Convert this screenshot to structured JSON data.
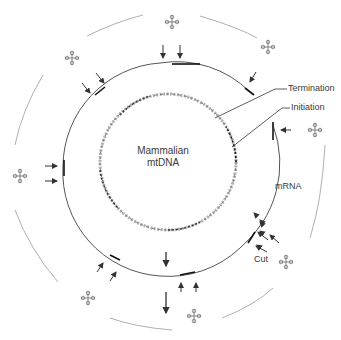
{
  "diagram": {
    "center_label_line1": "Mammalian",
    "center_label_line2": "mtDNA",
    "labels": {
      "termination": "Termination",
      "initiation": "Initiation",
      "mrna": "mRNA",
      "cut": "Cut"
    },
    "colors": {
      "line": "#555555",
      "dark": "#222222",
      "light_line": "#9a9a9a",
      "text": "#3a3a3a"
    },
    "elements": {
      "inner_circle": "mtDNA double helix ring",
      "middle_ring": "transcript ring with cut sites",
      "outer_arcs": "processed RNA fragments",
      "trna_icons": 8,
      "cut_arrows": 16
    }
  }
}
